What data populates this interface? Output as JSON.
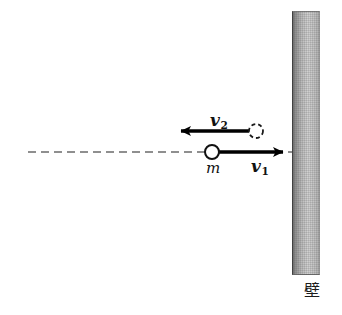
{
  "figure": {
    "title": "",
    "background_color": "#ffffff",
    "width": 342,
    "height": 315
  },
  "wall": {
    "label": "壁",
    "label_meaning": "wall",
    "color_dark": "#6e6e6e",
    "color_light": "#d2d2d2",
    "x": 292,
    "y": 11,
    "width": 28,
    "height": 264
  },
  "axis": {
    "name": "motion-centerline",
    "style": "dashed",
    "color": "#6b6b6b",
    "x_start": 28,
    "x_end": 292,
    "y": 152
  },
  "ball_incoming": {
    "name": "ball-at-contact",
    "style": "solid-outline",
    "mass_label": "m",
    "cx": 212,
    "cy": 152,
    "r": 7
  },
  "ball_outgoing": {
    "name": "ball-before-contact",
    "style": "dashed-outline",
    "cx": 256,
    "cy": 131,
    "r": 7
  },
  "vectors": [
    {
      "id": "v1",
      "symbol": "v",
      "subscript": "1",
      "direction": "right",
      "description": "incoming velocity toward wall",
      "x_start": 219,
      "x_end": 288,
      "y": 152,
      "color": "#000000"
    },
    {
      "id": "v2",
      "symbol": "v",
      "subscript": "2",
      "direction": "left",
      "description": "rebound velocity away from wall",
      "x_start": 254,
      "x_end": 176,
      "y": 131,
      "color": "#000000"
    }
  ],
  "colors": {
    "ink": "#111111",
    "axis": "#6b6b6b",
    "wall_dark": "#6e6e6e",
    "wall_light": "#d2d2d2"
  }
}
